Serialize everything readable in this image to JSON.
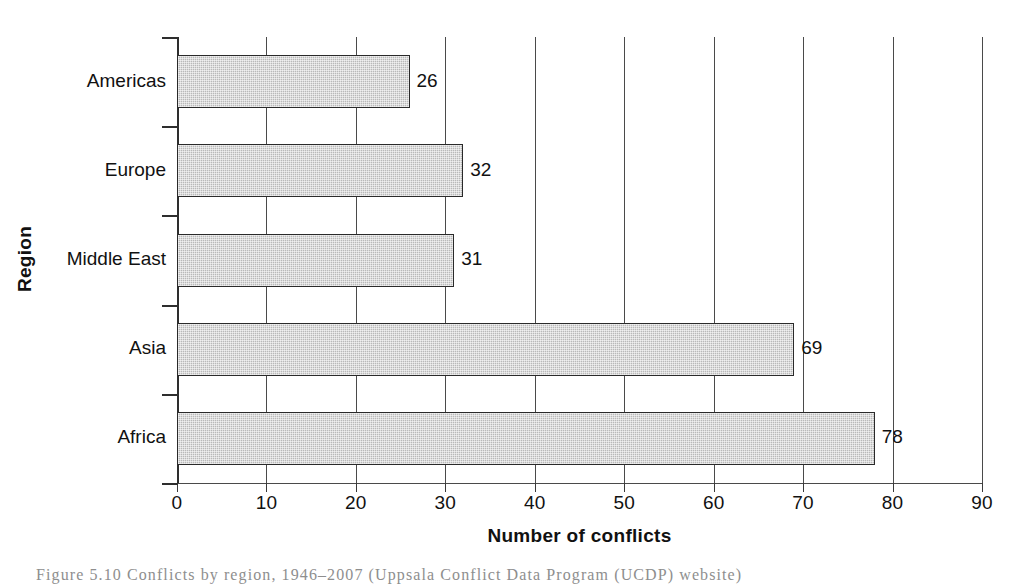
{
  "figure": {
    "caption": "Figure 5.10 Conflicts by region, 1946–2007 (Uppsala Conflict Data Program (UCDP) website)"
  },
  "chart_data": {
    "type": "bar",
    "orientation": "horizontal",
    "title": "",
    "xlabel": "Number of conflicts",
    "ylabel": "Region",
    "categories": [
      "Americas",
      "Europe",
      "Middle East",
      "Asia",
      "Africa"
    ],
    "values": [
      26,
      32,
      31,
      69,
      78
    ],
    "value_labels": [
      "26",
      "32",
      "31",
      "69",
      "78"
    ],
    "xlim": [
      0,
      90
    ],
    "xticks": [
      0,
      10,
      20,
      30,
      40,
      50,
      60,
      70,
      80,
      90
    ],
    "xticklabels": [
      "0",
      "10",
      "20",
      "30",
      "40",
      "50",
      "60",
      "70",
      "80",
      "90"
    ],
    "grid": "vertical",
    "legend": "none",
    "bar_fill_color": "#b9b9b9",
    "bar_edge_color": "#2a2a2a",
    "axis_color": "#3a3a3a",
    "background_color": "#ffffff"
  }
}
